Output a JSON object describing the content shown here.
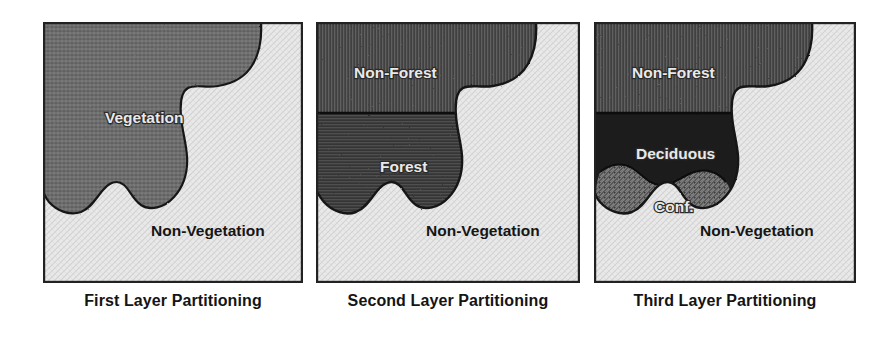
{
  "figure": {
    "panel_count": 3,
    "background_color": "#ffffff"
  },
  "panels": [
    {
      "id": "first-layer",
      "caption": "First Layer Partitioning",
      "border_color": "#222222",
      "regions": [
        {
          "name": "vegetation",
          "label": "Vegetation",
          "fill_color": "#6d6d6d",
          "texture": "speckled-dark-gray",
          "label_color": "#e9e9e9",
          "label_x": 62,
          "label_y": 101
        },
        {
          "name": "non-vegetation",
          "label": "Non-Vegetation",
          "fill_color": "#e4e4e4",
          "texture": "fine-light-crosshatch",
          "label_color": "#151515",
          "label_x": 108,
          "label_y": 214
        }
      ]
    },
    {
      "id": "second-layer",
      "caption": "Second Layer Partitioning",
      "border_color": "#222222",
      "regions": [
        {
          "name": "non-forest",
          "label": "Non-Forest",
          "fill_color": "#4a4a4a",
          "texture": "vertical-line-dark",
          "label_color": "#e9e9e9",
          "label_x": 38,
          "label_y": 56
        },
        {
          "name": "forest",
          "label": "Forest",
          "fill_color": "#3b3b3b",
          "texture": "horizontal-line-dark",
          "label_color": "#e9e9e9",
          "label_x": 64,
          "label_y": 150
        },
        {
          "name": "non-vegetation",
          "label": "Non-Vegetation",
          "fill_color": "#e4e4e4",
          "texture": "fine-light-crosshatch",
          "label_color": "#151515",
          "label_x": 110,
          "label_y": 214
        }
      ]
    },
    {
      "id": "third-layer",
      "caption": "Third Layer Partitioning",
      "border_color": "#222222",
      "regions": [
        {
          "name": "non-forest",
          "label": "Non-Forest",
          "fill_color": "#4a4a4a",
          "texture": "vertical-line-dark",
          "label_color": "#e9e9e9",
          "label_x": 38,
          "label_y": 56
        },
        {
          "name": "deciduous",
          "label": "Deciduous",
          "fill_color": "#1c1c1c",
          "texture": "solid-near-black",
          "label_color": "#ededed",
          "label_x": 42,
          "label_y": 137
        },
        {
          "name": "coniferous",
          "label": "Conf.",
          "fill_color": "#555555",
          "texture": "diagonal-hatch",
          "label_color": "#ededed",
          "label_x": 60,
          "label_y": 190
        },
        {
          "name": "non-vegetation",
          "label": "Non-Vegetation",
          "fill_color": "#e4e4e4",
          "texture": "fine-light-crosshatch",
          "label_color": "#151515",
          "label_x": 106,
          "label_y": 214
        }
      ]
    }
  ]
}
